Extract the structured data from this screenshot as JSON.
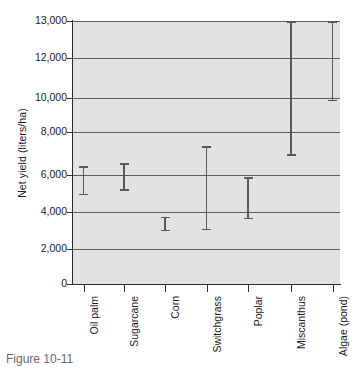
{
  "chart_data": {
    "type": "errorbar",
    "title": "",
    "xlabel": "",
    "ylabel": "Net yield (liters/ha)",
    "ylim": [
      0,
      13000
    ],
    "grid": true,
    "legend": false,
    "axis_note": "y-axis compressed between 12,000 and 13,000",
    "ytick_labels": [
      "0",
      "2,000",
      "4,000",
      "6,000",
      "8,000",
      "10,000",
      "12,000",
      "13,000"
    ],
    "ytick_values": [
      0,
      2000,
      4000,
      6000,
      8000,
      10000,
      12000,
      13000
    ],
    "categories": [
      "Oil palm",
      "Sugarcane",
      "Corn",
      "Switchgrass",
      "Poplar",
      "Miscanthus",
      "Algae (pond)"
    ],
    "series": [
      {
        "name": "Net yield range",
        "low": [
          4900,
          5150,
          2950,
          3000,
          3600,
          6900,
          9800
        ],
        "high": [
          6400,
          6550,
          3750,
          7350,
          5900,
          13000,
          13000
        ]
      }
    ],
    "points": [
      {
        "category": "Oil palm",
        "low": 4900,
        "high": 6400
      },
      {
        "category": "Sugarcane",
        "low": 5150,
        "high": 6550
      },
      {
        "category": "Corn",
        "low": 2950,
        "high": 3750
      },
      {
        "category": "Switchgrass",
        "low": 3000,
        "high": 7350
      },
      {
        "category": "Poplar",
        "low": 3600,
        "high": 5900
      },
      {
        "category": "Miscanthus",
        "low": 6900,
        "high": 13000
      },
      {
        "category": "Algae (pond)",
        "low": 9800,
        "high": 13000
      }
    ],
    "colors": {
      "plot_background": "#e2e2e2",
      "gridline": "#5d5d5d",
      "errorbar": "#5a5a5a",
      "axis": "#2b2b2b",
      "text": "#1c1c1c"
    }
  },
  "figure": {
    "ylabel": "Net yield (liters/ha)",
    "caption": "Figure 10-11"
  },
  "ytick_labels": [
    "13,000",
    "12,000",
    "10,000",
    "8,000",
    "6,000",
    "4,000",
    "2,000",
    "0"
  ],
  "xtick_labels": [
    "Oil palm",
    "Sugarcane",
    "Corn",
    "Switchgrass",
    "Poplar",
    "Miscanthus",
    "Algae (pond)"
  ]
}
